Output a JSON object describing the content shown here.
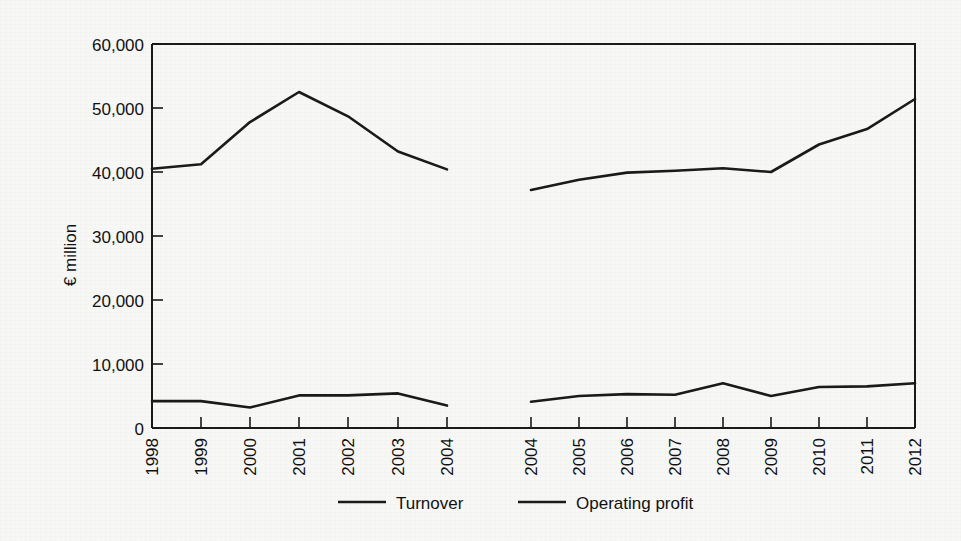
{
  "chart_data": {
    "type": "line",
    "title": "",
    "subtitle": "",
    "xlabel": "",
    "ylabel": "€ million",
    "ylim": [
      0,
      60000
    ],
    "ytick_labels": [
      "0",
      "10,000",
      "20,000",
      "30,000",
      "40,000",
      "50,000",
      "60,000"
    ],
    "ytick_values": [
      0,
      10000,
      20000,
      30000,
      40000,
      50000,
      60000
    ],
    "grid": false,
    "legend_position": "bottom",
    "legend": [
      "Turnover",
      "Operating profit"
    ],
    "panels": [
      {
        "name": "panel-left",
        "categories": [
          "1998",
          "1999",
          "2000",
          "2001",
          "2002",
          "2003",
          "2004"
        ],
        "series": [
          {
            "name": "Turnover",
            "values": [
              40500,
              41200,
              47800,
              52500,
              48700,
              43200,
              40400
            ]
          },
          {
            "name": "Operating profit",
            "values": [
              4200,
              4200,
              3200,
              5100,
              5100,
              5400,
              3500
            ]
          }
        ]
      },
      {
        "name": "panel-right",
        "categories": [
          "2004",
          "2005",
          "2006",
          "2007",
          "2008",
          "2009",
          "2010",
          "2011",
          "2012"
        ],
        "series": [
          {
            "name": "Turnover",
            "values": [
              37200,
              38800,
              39900,
              40200,
              40600,
              40000,
              44300,
              46700,
              51400
            ]
          },
          {
            "name": "Operating profit",
            "values": [
              4100,
              5000,
              5300,
              5200,
              7000,
              5000,
              6400,
              6500,
              7000
            ]
          }
        ]
      }
    ]
  },
  "colors": {
    "line": "#1a1a1a",
    "axis": "#1a1a1a",
    "background": "#f7f7f6",
    "text": "#111111"
  }
}
